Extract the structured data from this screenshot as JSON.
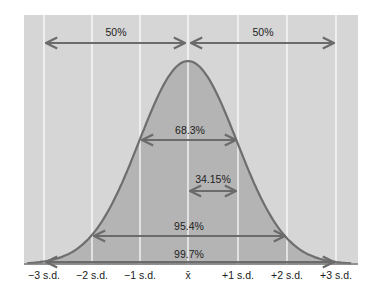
{
  "chart_data": {
    "type": "area",
    "title": "",
    "subtitle": "",
    "xlabel": "",
    "ylabel": "",
    "distribution": "normal",
    "x_ticks": [
      "−3 s.d.",
      "−2 s.d.",
      "−1 s.d.",
      "x̄",
      "+1 s.d.",
      "+2 s.d.",
      "+3 s.d."
    ],
    "x_values": [
      -3,
      -2,
      -1,
      0,
      1,
      2,
      3
    ],
    "grid": {
      "vertical": true,
      "horizontal": false
    },
    "xlim": [
      -3.3,
      3.5
    ],
    "annotations": [
      {
        "label": "50%",
        "from": -3,
        "to": 0,
        "level": "top"
      },
      {
        "label": "50%",
        "from": 0,
        "to": 3,
        "level": "top"
      },
      {
        "label": "68.3%",
        "from": -1,
        "to": 1,
        "level": "upper-mid"
      },
      {
        "label": "34.15%",
        "from": 0,
        "to": 1,
        "level": "mid"
      },
      {
        "label": "95.4%",
        "from": -2,
        "to": 2,
        "level": "lower-mid"
      },
      {
        "label": "99.7%",
        "from": -3,
        "to": 3,
        "level": "bottom"
      }
    ]
  },
  "colors": {
    "panel": "#d6d6d6",
    "shaded": "#b4b4b4",
    "gridline": "#ffffff",
    "curve": "#6e6e6e",
    "arrow": "#6b6b6b"
  },
  "labels": {
    "top_left": "50%",
    "top_right": "50%",
    "one_sd": "68.3%",
    "half_sd": "34.15%",
    "two_sd": "95.4%",
    "three_sd": "99.7%"
  },
  "ticks": {
    "m3": "−3 s.d.",
    "m2": "−2 s.d.",
    "m1": "−1 s.d.",
    "mean": "x̄",
    "p1": "+1 s.d.",
    "p2": "+2 s.d.",
    "p3": "+3 s.d."
  }
}
